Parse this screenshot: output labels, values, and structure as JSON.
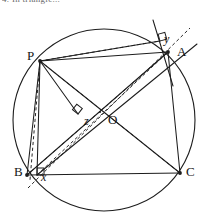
{
  "figure": {
    "kind": "euclidean-geometry-diagram",
    "header_text": "4. In triangle...",
    "background_color": "#ffffff",
    "stroke_color": "#1d1d1d",
    "canvas": {
      "width": 206,
      "height": 224
    }
  },
  "circle": {
    "name": "circumcircle",
    "center": {
      "x": 104,
      "y": 120
    },
    "radius": 91,
    "style": "solid"
  },
  "points": [
    {
      "id": "P",
      "label": "P",
      "x": 40,
      "y": 61,
      "label_x": 27,
      "label_y": 48,
      "style": "cap"
    },
    {
      "id": "A",
      "label": "A",
      "x": 168,
      "y": 52,
      "label_x": 177,
      "label_y": 44,
      "style": "cap"
    },
    {
      "id": "B",
      "label": "B",
      "x": 27,
      "y": 175,
      "label_x": 14,
      "label_y": 164,
      "style": "cap"
    },
    {
      "id": "C",
      "label": "C",
      "x": 180,
      "y": 173,
      "label_x": 186,
      "label_y": 164,
      "style": "cap"
    },
    {
      "id": "O",
      "label": "O",
      "x": 104,
      "y": 120,
      "label_x": 108,
      "label_y": 112,
      "style": "cap"
    },
    {
      "id": "x",
      "label": "x",
      "x": 37,
      "y": 175,
      "label_x": 41,
      "label_y": 170,
      "style": "ital"
    },
    {
      "id": "y",
      "label": "y",
      "x": 160,
      "y": 41,
      "label_x": 164,
      "label_y": 32,
      "style": "ital"
    },
    {
      "id": "z",
      "label": "z",
      "x": 78,
      "y": 114,
      "label_x": 84,
      "label_y": 114,
      "style": "ital"
    }
  ],
  "solid_segments": [
    {
      "name": "side-BC",
      "from": "B",
      "to": "C",
      "x1": 27,
      "y1": 175,
      "x2": 180,
      "y2": 173
    },
    {
      "name": "side-AB",
      "from": "A",
      "to": "B",
      "x1": 168,
      "y1": 52,
      "x2": 27,
      "y2": 175
    },
    {
      "name": "side-AC",
      "from": "A",
      "to": "C",
      "x1": 168,
      "y1": 52,
      "x2": 180,
      "y2": 173
    },
    {
      "name": "chord-PA",
      "from": "P",
      "to": "A",
      "x1": 40,
      "y1": 61,
      "x2": 168,
      "y2": 52
    },
    {
      "name": "chord-PB",
      "from": "P",
      "to": "B",
      "x1": 40,
      "y1": 61,
      "x2": 27,
      "y2": 175
    },
    {
      "name": "chord-PC",
      "from": "P",
      "to": "C",
      "x1": 40,
      "y1": 61,
      "x2": 180,
      "y2": 173
    },
    {
      "name": "perpendicular-P-to-x",
      "from": "P",
      "to": "x",
      "x1": 40,
      "y1": 61,
      "x2": 37,
      "y2": 175
    },
    {
      "name": "perpendicular-P-to-z",
      "from": "P",
      "to": "z",
      "x1": 40,
      "y1": 61,
      "x2": 78,
      "y2": 114
    },
    {
      "name": "perpendicular-P-to-y",
      "from": "P",
      "to": "y",
      "x1": 40,
      "y1": 61,
      "x2": 160,
      "y2": 41
    },
    {
      "name": "tangent-at-A",
      "x1": 153,
      "y1": 20,
      "x2": 173,
      "y2": 86
    },
    {
      "name": "simson-ray-through-A",
      "x1": 37,
      "y1": 175,
      "x2": 197,
      "y2": 44
    }
  ],
  "dashed_segments": [
    {
      "name": "dashed-x-to-y",
      "x1": 28,
      "y1": 188,
      "x2": 190,
      "y2": 28
    },
    {
      "name": "dashed-P-to-C",
      "from": "P",
      "to": "C",
      "x1": 40,
      "y1": 61,
      "x2": 180,
      "y2": 173
    },
    {
      "name": "dashed-B-to-A",
      "from": "B",
      "to": "A",
      "x1": 27,
      "y1": 175,
      "x2": 168,
      "y2": 52
    },
    {
      "name": "dashed-P-to-x-offset",
      "x1": 40,
      "y1": 61,
      "x2": 30,
      "y2": 180
    },
    {
      "name": "dashed-P-to-y-chord",
      "x1": 40,
      "y1": 61,
      "x2": 160,
      "y2": 41
    },
    {
      "name": "dashed-x-to-A",
      "x1": 37,
      "y1": 175,
      "x2": 168,
      "y2": 52
    }
  ],
  "right_angle_marks": [
    {
      "name": "right-angle-at-x",
      "x": 37,
      "y": 175,
      "rotation": 0
    },
    {
      "name": "right-angle-at-y",
      "x": 160,
      "y": 41,
      "rotation": -16
    },
    {
      "name": "right-angle-at-z",
      "x": 78,
      "y": 114,
      "rotation": -52
    }
  ],
  "vertex_dots": [
    {
      "name": "dot-P",
      "x": 40,
      "y": 61
    },
    {
      "name": "dot-A",
      "x": 168,
      "y": 52
    },
    {
      "name": "dot-B",
      "x": 27,
      "y": 175
    },
    {
      "name": "dot-C",
      "x": 180,
      "y": 173
    },
    {
      "name": "dot-O",
      "x": 104,
      "y": 120
    }
  ]
}
